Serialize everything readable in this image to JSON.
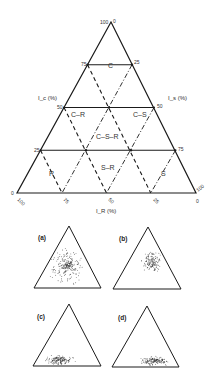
{
  "diagram": {
    "type": "ternary",
    "axes": {
      "left": {
        "label": "I_c (%)",
        "ticks": [
          "0",
          "25",
          "50",
          "75",
          "100"
        ]
      },
      "right": {
        "label": "I_s (%)",
        "ticks": [
          "0",
          "25",
          "50",
          "75",
          "100"
        ]
      },
      "bottom": {
        "label": "I_R (%)",
        "ticks": [
          "100",
          "75",
          "50",
          "25",
          "0"
        ]
      }
    },
    "regions": [
      {
        "id": "C",
        "label": "C"
      },
      {
        "id": "C-R",
        "label": "C–R"
      },
      {
        "id": "C-S",
        "label": "C–S"
      },
      {
        "id": "C-S-R",
        "label": "C–S–R"
      },
      {
        "id": "S-R",
        "label": "S–R"
      },
      {
        "id": "R",
        "label": "R"
      },
      {
        "id": "S",
        "label": "S"
      }
    ],
    "panels": [
      {
        "label": "(a)",
        "description": "points clustered in centre"
      },
      {
        "label": "(b)",
        "description": "points clustered upper-right (C–S)"
      },
      {
        "label": "(c)",
        "description": "points clustered bottom-left (R)"
      },
      {
        "label": "(d)",
        "description": "points clustered bottom-right (S)"
      }
    ],
    "colors": {
      "line": "#1a1a1a",
      "text": "#333333",
      "background": "#ffffff"
    }
  }
}
